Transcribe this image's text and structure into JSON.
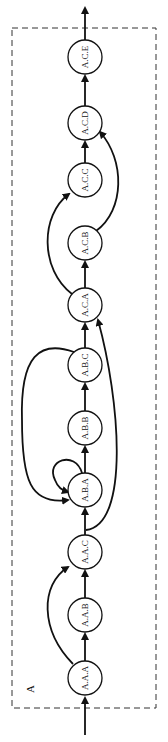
{
  "diagram": {
    "boundary_label": "A",
    "nodes": [
      {
        "id": "A.A.A",
        "label": "A.A.A",
        "cy": 678
      },
      {
        "id": "A.A.B",
        "label": "A.A.B",
        "cy": 615
      },
      {
        "id": "A.A.C",
        "label": "A.A.C",
        "cy": 552
      },
      {
        "id": "A.B.A",
        "label": "A.B.A",
        "cy": 490
      },
      {
        "id": "A.B.B",
        "label": "A.B.B",
        "cy": 428
      },
      {
        "id": "A.B.C",
        "label": "A.B.C",
        "cy": 365
      },
      {
        "id": "A.C.A",
        "label": "A.C.A",
        "cy": 305
      },
      {
        "id": "A.C.B",
        "label": "A.C.B",
        "cy": 243
      },
      {
        "id": "A.C.C",
        "label": "A.C.C",
        "cy": 180
      },
      {
        "id": "A.C.D",
        "label": "A.C.D",
        "cy": 123
      },
      {
        "id": "A.C.E",
        "label": "A.C.E",
        "cy": 57
      }
    ],
    "edges": [
      {
        "from": "input",
        "to": "A.A.A"
      },
      {
        "from": "A.A.A",
        "to": "A.A.B"
      },
      {
        "from": "A.A.A",
        "to": "A.A.C"
      },
      {
        "from": "A.A.B",
        "to": "A.A.C"
      },
      {
        "from": "A.A.C",
        "to": "A.B.A"
      },
      {
        "from": "A.A.C",
        "to": "A.C.A"
      },
      {
        "from": "A.B.A",
        "to": "A.B.A"
      },
      {
        "from": "A.B.A",
        "to": "A.B.B"
      },
      {
        "from": "A.B.B",
        "to": "A.B.C"
      },
      {
        "from": "A.B.C",
        "to": "A.B.A"
      },
      {
        "from": "A.B.C",
        "to": "A.C.A"
      },
      {
        "from": "A.C.A",
        "to": "A.C.B"
      },
      {
        "from": "A.C.A",
        "to": "A.C.C"
      },
      {
        "from": "A.C.B",
        "to": "A.C.D"
      },
      {
        "from": "A.C.C",
        "to": "A.C.D"
      },
      {
        "from": "A.C.D",
        "to": "A.C.E"
      },
      {
        "from": "A.C.E",
        "to": "output"
      }
    ]
  }
}
